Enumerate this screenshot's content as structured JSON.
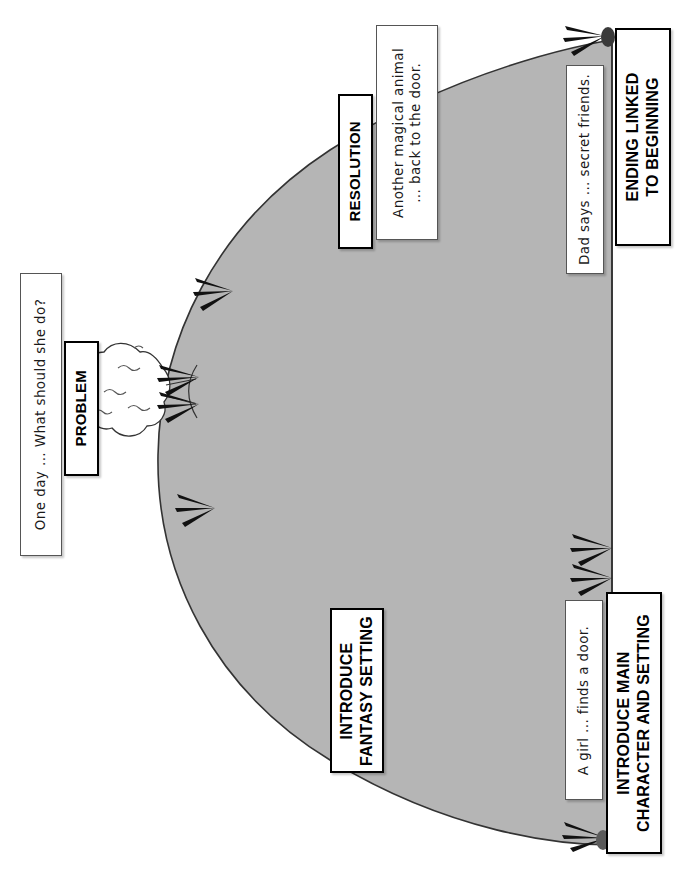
{
  "diagram": {
    "shape": "story-arc-ellipse",
    "arc_fill": "#b5b5b5",
    "arc_stroke": "#333333",
    "orientation": "rotated-90-ccw"
  },
  "stage_labels": [
    {
      "id": "problem",
      "text": "PROBLEM"
    },
    {
      "id": "resolution",
      "text": "RESOLUTION"
    },
    {
      "id": "ending-linked",
      "line1": "ENDING LINKED",
      "line2": "TO BEGINNING"
    },
    {
      "id": "introduce-fantasy",
      "line1": "INTRODUCE",
      "line2": "FANTASY SETTING"
    },
    {
      "id": "introduce-main-character",
      "line1": "INTRODUCE MAIN",
      "line2": "CHARACTER AND SETTING"
    }
  ],
  "detail_notes": [
    {
      "id": "problem-note",
      "text": "One day ... What should she do?"
    },
    {
      "id": "resolution-note",
      "line1": "Another magical animal",
      "line2": "... back to the door."
    },
    {
      "id": "ending-note",
      "text": "Dad says ... secret friends."
    },
    {
      "id": "opening-note",
      "text": "A girl ... finds a door."
    }
  ],
  "icons": {
    "thought_cloud": "thought-cloud-icon",
    "arrow_head": "hand-drawn-arrowhead-icon",
    "pin": "pin-icon"
  },
  "arrowheads": [
    {
      "id": "arrow-upper-left",
      "points_to": "arc-upper-left-edge"
    },
    {
      "id": "arrow-mid-left-upper",
      "points_to": "arc-left-edge-problem"
    },
    {
      "id": "arrow-mid-left-lower",
      "points_to": "arc-left-edge-problem-2"
    },
    {
      "id": "arrow-lower-left",
      "points_to": "arc-lower-left-edge"
    },
    {
      "id": "arrow-top-right",
      "points_to": "arc-apex-right"
    },
    {
      "id": "arrow-right-upper",
      "points_to": "arc-right-baseline"
    },
    {
      "id": "arrow-right-lower",
      "points_to": "arc-right-baseline-2"
    },
    {
      "id": "arrow-bottom-right",
      "points_to": "arc-bottom-right-origin"
    }
  ]
}
